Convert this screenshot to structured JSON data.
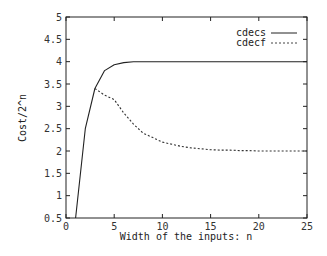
{
  "chart_data": {
    "type": "line",
    "title": "",
    "xlabel": "Width of the inputs: n",
    "ylabel": "Cost/2^n",
    "xlim": [
      0,
      25
    ],
    "ylim": [
      0.5,
      5
    ],
    "xticks": [
      0,
      5,
      10,
      15,
      20,
      25
    ],
    "yticks": [
      0.5,
      1,
      1.5,
      2,
      2.5,
      3,
      3.5,
      4,
      4.5,
      5
    ],
    "xtick_labels": [
      "0",
      "5",
      "10",
      "15",
      "20",
      "25"
    ],
    "ytick_labels": [
      "0.5",
      "1",
      "1.5",
      "2",
      "2.5",
      "3",
      "3.5",
      "4",
      "4.5",
      "5"
    ],
    "grid": false,
    "legend_position": "top-right",
    "series": [
      {
        "name": "cdecs",
        "style": "solid",
        "color": "#222222",
        "x": [
          1,
          2,
          3,
          4,
          5,
          6,
          7,
          8,
          9,
          10,
          11,
          12,
          13,
          14,
          15,
          16,
          17,
          18,
          19,
          20,
          21,
          22,
          23,
          24,
          25
        ],
        "values": [
          0.5,
          2.5,
          3.4,
          3.8,
          3.93,
          3.98,
          4.0,
          4.0,
          4.0,
          4.0,
          4.0,
          4.0,
          4.0,
          4.0,
          4.0,
          4.0,
          4.0,
          4.0,
          4.0,
          4.0,
          4.0,
          4.0,
          4.0,
          4.0,
          4.0
        ]
      },
      {
        "name": "cdecf",
        "style": "dashed",
        "color": "#333333",
        "x": [
          3,
          4,
          5,
          6,
          7,
          8,
          9,
          10,
          11,
          12,
          13,
          14,
          15,
          16,
          17,
          18,
          19,
          20,
          21,
          22,
          23,
          24,
          25
        ],
        "values": [
          3.4,
          3.25,
          3.15,
          2.85,
          2.6,
          2.4,
          2.3,
          2.2,
          2.15,
          2.1,
          2.07,
          2.05,
          2.03,
          2.02,
          2.02,
          2.01,
          2.01,
          2.0,
          2.0,
          2.0,
          2.0,
          2.0,
          2.0
        ]
      }
    ]
  },
  "legend": {
    "items": [
      {
        "label": "cdecs"
      },
      {
        "label": "cdecf"
      }
    ]
  }
}
